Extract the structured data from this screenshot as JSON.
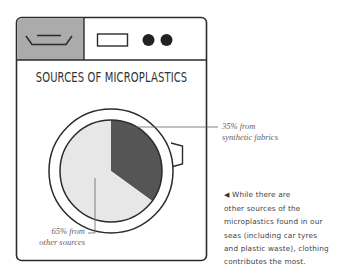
{
  "colors": {
    "outline": "#2b2b2b",
    "detergent_panel": "#ababab",
    "synthetic_slice": "#555555",
    "other_slice": "#e7e7e7",
    "leader_line": "#666666",
    "title_text": "#333333"
  },
  "icons": {
    "washer": "washing-machine-icon",
    "detergent_drawer": "detergent-drawer-icon",
    "display": "display-panel-icon",
    "knobs": "control-knob-icon",
    "door_latch": "door-latch-icon",
    "note_bullet": "left-triangle-icon"
  },
  "chart_data": {
    "type": "pie",
    "title": "SOURCES OF MICROPLASTICS",
    "start_angle": "12 o'clock",
    "direction": "clockwise",
    "slices": [
      {
        "name": "synthetic fabrics",
        "value": 35,
        "unit": "%",
        "label_line1": "35% from",
        "label_line2": "synthetic fabrics"
      },
      {
        "name": "other sources",
        "value": 65,
        "unit": "%",
        "label_line1": "65% from",
        "label_line2": "other sources"
      }
    ]
  },
  "note": {
    "bullet": "◀",
    "lines": [
      "While there are",
      "other sources of the",
      "microplastics found in our",
      "seas (including car tyres",
      "and plastic waste), clothing",
      "contributes the most."
    ]
  }
}
